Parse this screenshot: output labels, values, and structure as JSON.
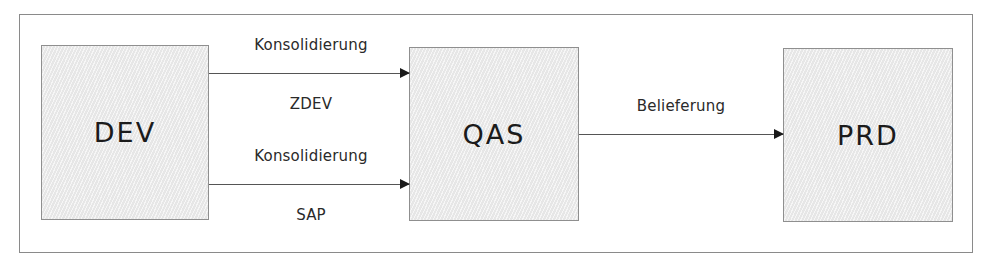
{
  "diagram": {
    "nodes": [
      {
        "id": "dev",
        "label": "DEV"
      },
      {
        "id": "qas",
        "label": "QAS"
      },
      {
        "id": "prd",
        "label": "PRD"
      }
    ],
    "edges": [
      {
        "from": "DEV",
        "to": "QAS",
        "label_above": "Konsolidierung",
        "label_below": "ZDEV"
      },
      {
        "from": "DEV",
        "to": "QAS",
        "label_above": "Konsolidierung",
        "label_below": "SAP"
      },
      {
        "from": "QAS",
        "to": "PRD",
        "label_above": "Belieferung",
        "label_below": ""
      }
    ],
    "colors": {
      "frame_border": "#8a8a8a",
      "node_fill": "#ececec",
      "node_border": "#8f8f8f",
      "arrow": "#555555",
      "arrow_head": "#1a1a1a",
      "text": "#1b1b1b"
    }
  }
}
